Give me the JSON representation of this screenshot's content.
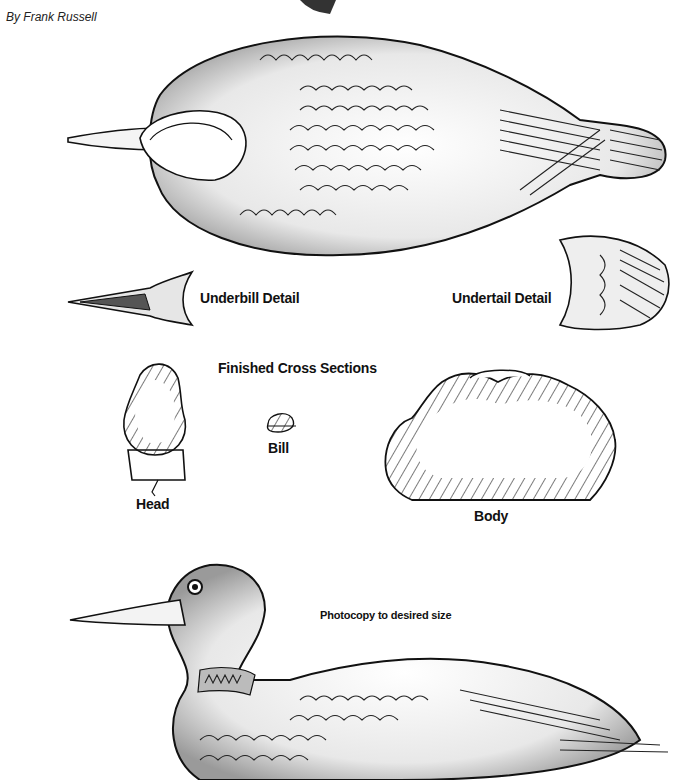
{
  "byline": "By Frank Russell",
  "labels": {
    "underbill": "Underbill Detail",
    "undertail": "Undertail Detail",
    "cross_sections": "Finished Cross Sections",
    "head": "Head",
    "bill": "Bill",
    "body": "Body",
    "photocopy": "Photocopy to desired size"
  },
  "figures": [
    {
      "name": "top-view-loon",
      "description": "Loon viewed from above"
    },
    {
      "name": "underbill-detail",
      "description": "Underside of bill"
    },
    {
      "name": "undertail-detail",
      "description": "Underside of tail"
    },
    {
      "name": "head-cross-section",
      "description": "Head cross section"
    },
    {
      "name": "bill-cross-section",
      "description": "Bill cross section"
    },
    {
      "name": "body-cross-section",
      "description": "Body cross section"
    },
    {
      "name": "side-view-loon",
      "description": "Loon side profile"
    }
  ]
}
